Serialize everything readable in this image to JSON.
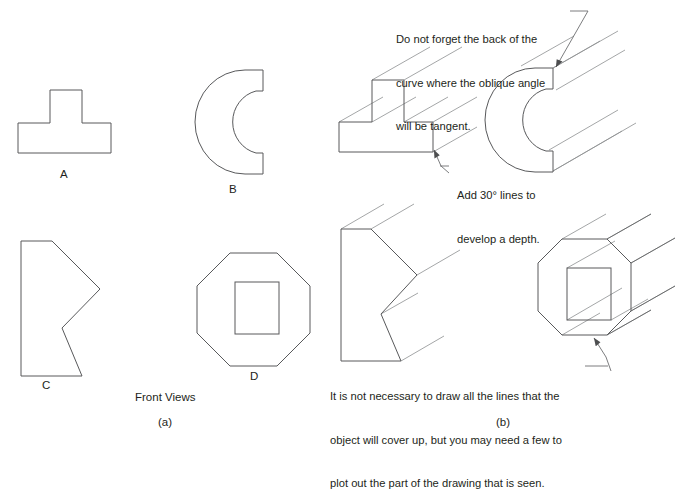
{
  "figure": {
    "background_color": "#ffffff",
    "outline_color": "#58595b",
    "projection_line_color": "#8d8f91",
    "leader_color": "#6d6e71",
    "text_color": "#231f20"
  },
  "panels": [
    {
      "id": "a",
      "label": "(a)",
      "caption": "Front Views"
    },
    {
      "id": "b",
      "label": "(b)",
      "caption": ""
    }
  ],
  "front_views": {
    "heading": "Front Views",
    "shapes": [
      {
        "key": "A",
        "label": "A",
        "description": "tee-shape"
      },
      {
        "key": "B",
        "label": "B",
        "description": "crescent-c-shape"
      },
      {
        "key": "C",
        "label": "C",
        "description": "chevron-notched-polygon"
      },
      {
        "key": "D",
        "label": "D",
        "description": "octagon-with-square-hole"
      }
    ]
  },
  "annotations": [
    {
      "id": "back-of-curve",
      "lines": [
        "Do not forget the back of the",
        "curve where the oblique angle",
        "will be tangent."
      ]
    },
    {
      "id": "add-30-degree-lines",
      "lines": [
        "Add 30° lines to",
        "develop a depth."
      ]
    },
    {
      "id": "hidden-lines-note",
      "lines": [
        "It is not necessary to draw all the lines that the",
        "object will cover up, but you may need a few to",
        "plot out the part of the drawing that is seen."
      ]
    }
  ],
  "labels": {
    "a": "A",
    "b": "B",
    "c": "C",
    "d": "D",
    "front_views": "Front Views",
    "panel_a": "(a)",
    "panel_b": "(b)"
  },
  "annotation_text": {
    "curve_line1": "Do not forget the back of the",
    "curve_line2": "curve where the oblique angle",
    "curve_line3": "will be tangent.",
    "depth_line1": "Add 30° lines to",
    "depth_line2": "develop a depth.",
    "hidden_line1": "It is not necessary to draw all the lines that the",
    "hidden_line2": "object will cover up, but you may need a few to",
    "hidden_line3": "plot out the part of the drawing that is seen."
  }
}
